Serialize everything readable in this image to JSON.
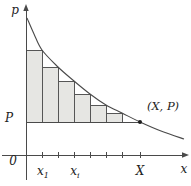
{
  "labels": {
    "p_axis": "p",
    "x_axis": "x",
    "origin": "0",
    "price": "P",
    "x1": {
      "base": "x",
      "sub": "1"
    },
    "xi": {
      "base": "x",
      "sub": "i"
    },
    "capital_x": "X",
    "point": "(X, P)"
  },
  "figure": {
    "width": 191,
    "height": 186,
    "x_axis": {
      "x1": 2,
      "x2": 186,
      "y": 155
    },
    "y_axis": {
      "x": 26,
      "y1": 7,
      "y2": 180
    },
    "arrow_x": "189,155 182,152.3 182,157.7",
    "arrow_y": "26,4 23.3,11 28.7,11",
    "p_line": {
      "x1": 26,
      "x2": 140,
      "y": 122
    },
    "point_marker": {
      "x": 140,
      "y": 122,
      "r": 2
    },
    "ticks": [
      42,
      58,
      74,
      90,
      106,
      122,
      140
    ],
    "tick_y1": 152,
    "tick_y2": 158,
    "bars": {
      "bottom": 122,
      "items": [
        {
          "x1": 26,
          "x2": 42,
          "top": 50
        },
        {
          "x1": 42,
          "x2": 58,
          "top": 67
        },
        {
          "x1": 58,
          "x2": 74,
          "top": 81
        },
        {
          "x1": 74,
          "x2": 90,
          "top": 94
        },
        {
          "x1": 90,
          "x2": 106,
          "top": 105
        },
        {
          "x1": 106,
          "x2": 122,
          "top": 113
        }
      ]
    },
    "curve_points": [
      [
        27,
        18
      ],
      [
        34,
        34
      ],
      [
        42,
        50
      ],
      [
        58,
        67
      ],
      [
        74,
        81
      ],
      [
        90,
        94
      ],
      [
        106,
        105
      ],
      [
        122,
        113
      ],
      [
        140,
        122
      ],
      [
        161,
        131
      ],
      [
        184,
        139
      ]
    ],
    "colors": {
      "line": "#4a4a4a",
      "bar_fill": "#e6e6e3",
      "bar_stroke": "#565656",
      "point": "#1c1c1c",
      "text": "#222222",
      "background": "#ffffff"
    }
  }
}
